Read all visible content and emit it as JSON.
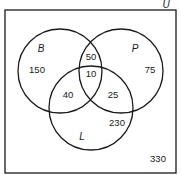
{
  "diagram": {
    "type": "venn-3-set",
    "universe_label": "U",
    "sets": [
      {
        "label": "B",
        "cx": 60,
        "cy": 71,
        "r": 42,
        "label_x": 41,
        "label_y": 52
      },
      {
        "label": "P",
        "cx": 121,
        "cy": 71,
        "r": 42,
        "label_x": 135,
        "label_y": 52
      },
      {
        "label": "L",
        "cx": 91,
        "cy": 108,
        "r": 42,
        "label_x": 82,
        "label_y": 140
      }
    ],
    "regions": [
      {
        "name": "B only",
        "value": "150",
        "x": 37,
        "y": 73
      },
      {
        "name": "P only",
        "value": "75",
        "x": 150,
        "y": 73
      },
      {
        "name": "B and P only",
        "value": "50",
        "x": 91,
        "y": 60
      },
      {
        "name": "B and P and L",
        "value": "10",
        "x": 91,
        "y": 77
      },
      {
        "name": "B and L only",
        "value": "40",
        "x": 68,
        "y": 98
      },
      {
        "name": "P and L only",
        "value": "25",
        "x": 113,
        "y": 98
      },
      {
        "name": "L only",
        "value": "230",
        "x": 117,
        "y": 126
      },
      {
        "name": "outside all sets",
        "value": "330",
        "x": 158,
        "y": 162
      }
    ],
    "universe_box": {
      "x": 5,
      "y": 10,
      "width": 171,
      "height": 163
    },
    "universe_label_pos": {
      "x": 166,
      "y": 8
    }
  }
}
